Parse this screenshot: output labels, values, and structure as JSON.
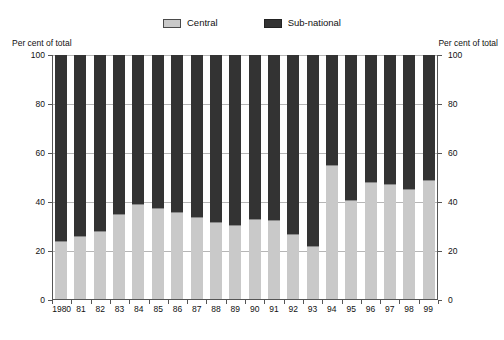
{
  "legend": {
    "entries": [
      {
        "label": "Central",
        "color": "#c9c9c9",
        "icon": "legend-swatch-central"
      },
      {
        "label": "Sub-national",
        "color": "#333333",
        "icon": "legend-swatch-subnational"
      }
    ]
  },
  "axes": {
    "left_caption": "Per cent of total",
    "right_caption": "Per cent of total",
    "y_ticks": [
      "0",
      "20",
      "40",
      "60",
      "80",
      "100"
    ]
  },
  "chart_data": {
    "type": "bar",
    "stacked": true,
    "title": "",
    "subtitle": "",
    "xlabel": "",
    "ylabel": "Per cent of total",
    "ylim": [
      0,
      100
    ],
    "yticks": [
      0,
      20,
      40,
      60,
      80,
      100
    ],
    "grid": true,
    "legend_position": "top-center",
    "categories": [
      "1980",
      "81",
      "82",
      "83",
      "84",
      "85",
      "86",
      "87",
      "88",
      "89",
      "90",
      "91",
      "92",
      "93",
      "94",
      "95",
      "96",
      "97",
      "98",
      "99"
    ],
    "series": [
      {
        "name": "Central",
        "color": "#c9c9c9",
        "values": [
          24,
          26,
          28,
          35,
          39,
          37.5,
          36,
          34,
          32,
          30.5,
          33,
          32.5,
          27,
          22,
          55,
          41,
          48,
          47.5,
          45.5,
          49
        ]
      },
      {
        "name": "Sub-national",
        "color": "#333333",
        "values": [
          76,
          74,
          72,
          65,
          61,
          62.5,
          64,
          66,
          68,
          69.5,
          67,
          67.5,
          73,
          78,
          45,
          59,
          52,
          52.5,
          54.5,
          51
        ]
      }
    ]
  }
}
